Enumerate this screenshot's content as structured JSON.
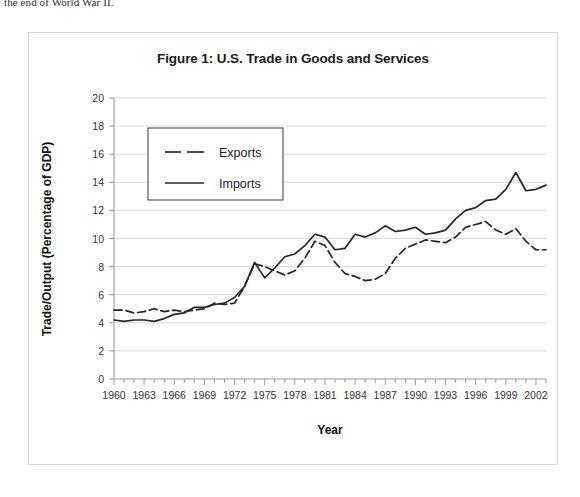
{
  "page": {
    "top_text_fragment": "the end of World War II."
  },
  "figure": {
    "title": "Figure 1: U.S. Trade in Goods and Services",
    "frame_border_color": "#d6d6d6",
    "background": "#ffffff"
  },
  "chart_data": {
    "type": "line",
    "title": "Figure 1: U.S. Trade in Goods and Services",
    "xlabel": "Year",
    "ylabel": "Trade/Output (Percentage of GDP)",
    "ylim": [
      0,
      20
    ],
    "ytick_step": 2,
    "ytick_labels": [
      "0",
      "2",
      "4",
      "6",
      "8",
      "10",
      "12",
      "14",
      "16",
      "18",
      "20"
    ],
    "xlim": [
      1960,
      2003
    ],
    "xtick_step": 3,
    "xtick_labels": [
      "1960",
      "1963",
      "1966",
      "1969",
      "1972",
      "1975",
      "1978",
      "1981",
      "1984",
      "1987",
      "1990",
      "1993",
      "1996",
      "1999",
      "2002"
    ],
    "grid": true,
    "grid_axis": "y",
    "grid_color": "#d9d9d9",
    "legend_position": "upper-left-inset",
    "line_color": "#262626",
    "x": [
      1960,
      1961,
      1962,
      1963,
      1964,
      1965,
      1966,
      1967,
      1968,
      1969,
      1970,
      1971,
      1972,
      1973,
      1974,
      1975,
      1976,
      1977,
      1978,
      1979,
      1980,
      1981,
      1982,
      1983,
      1984,
      1985,
      1986,
      1987,
      1988,
      1989,
      1990,
      1991,
      1992,
      1993,
      1994,
      1995,
      1996,
      1997,
      1998,
      1999,
      2000,
      2001,
      2002,
      2003
    ],
    "series": [
      {
        "name": "Exports",
        "style": "dashed",
        "values": [
          4.9,
          4.9,
          4.7,
          4.8,
          5.0,
          4.8,
          4.9,
          4.8,
          4.9,
          5.0,
          5.4,
          5.3,
          5.4,
          6.6,
          8.2,
          8.0,
          7.7,
          7.4,
          7.7,
          8.6,
          9.8,
          9.5,
          8.3,
          7.5,
          7.3,
          7.0,
          7.1,
          7.5,
          8.6,
          9.3,
          9.6,
          9.9,
          9.8,
          9.7,
          10.1,
          10.8,
          11.0,
          11.2,
          10.6,
          10.3,
          10.7,
          9.8,
          9.2,
          9.2
        ]
      },
      {
        "name": "Imports",
        "style": "solid",
        "values": [
          4.2,
          4.1,
          4.2,
          4.2,
          4.1,
          4.3,
          4.6,
          4.7,
          5.1,
          5.1,
          5.3,
          5.4,
          5.8,
          6.6,
          8.3,
          7.2,
          7.9,
          8.7,
          8.9,
          9.5,
          10.3,
          10.1,
          9.2,
          9.3,
          10.3,
          10.1,
          10.4,
          10.9,
          10.5,
          10.6,
          10.8,
          10.3,
          10.4,
          10.6,
          11.4,
          12.0,
          12.2,
          12.7,
          12.8,
          13.5,
          14.7,
          13.4,
          13.5,
          13.8
        ]
      }
    ]
  },
  "legend": {
    "items": [
      {
        "label": "Exports",
        "style": "dashed"
      },
      {
        "label": "Imports",
        "style": "solid"
      }
    ]
  }
}
